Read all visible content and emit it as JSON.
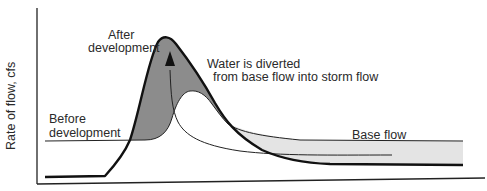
{
  "figure": {
    "type": "hydrograph-diagram",
    "y_axis_label": "Rate of flow, cfs",
    "x_axis_label": "",
    "labels": {
      "after_line1": "After",
      "after_line2": "development",
      "before_line1": "Before",
      "before_line2": "development",
      "diverted_line1": "Water is diverted",
      "diverted_line2": "from base flow into storm flow",
      "base_flow": "Base flow"
    },
    "colors": {
      "line": "#111111",
      "storm_increase_fill": "#8c8c8c",
      "base_flow_fill": "#e4e4e4",
      "background": "#ffffff"
    },
    "curves": [
      {
        "name": "After development",
        "style": "thick",
        "description": "Sharp tall peak, reduced base flow"
      },
      {
        "name": "Before development",
        "style": "thin",
        "description": "Lower broad peak, higher base flow"
      },
      {
        "name": "Diverted flow path",
        "style": "thin",
        "description": "Arrow indicating base flow diverted to storm flow"
      }
    ]
  }
}
